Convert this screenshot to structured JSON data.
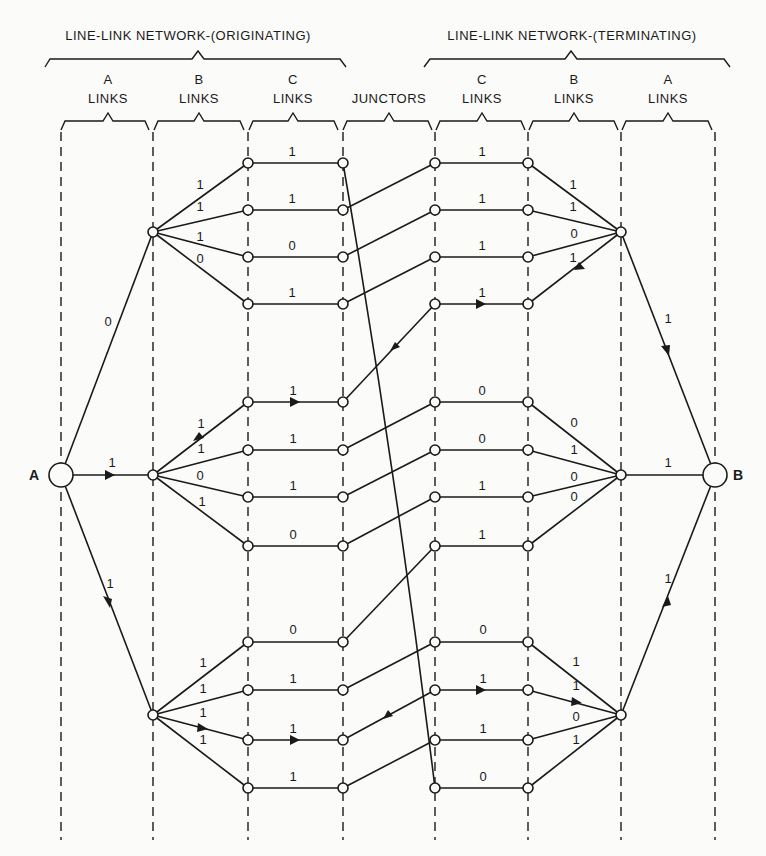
{
  "headers": {
    "originating": "LINE-LINK NETWORK-(ORIGINATING)",
    "terminating": "LINE-LINK NETWORK-(TERMINATING)"
  },
  "columns": [
    {
      "top": "A",
      "bottom": "LINKS"
    },
    {
      "top": "B",
      "bottom": "LINKS"
    },
    {
      "top": "C",
      "bottom": "LINKS"
    },
    {
      "top": "",
      "bottom": "JUNCTORS"
    },
    {
      "top": "C",
      "bottom": "LINKS"
    },
    {
      "top": "B",
      "bottom": "LINKS"
    },
    {
      "top": "A",
      "bottom": "LINKS"
    }
  ],
  "terminals": {
    "left": "A",
    "right": "B"
  },
  "bits": {
    "a_left_top": "0",
    "a_left_mid": "1",
    "a_left_bot": "1",
    "a_right_top": "1",
    "a_right_mid": "1",
    "a_right_bot": "1",
    "bl_top": [
      "1",
      "1",
      "1",
      "0"
    ],
    "bl_mid": [
      "1",
      "1",
      "0",
      "1"
    ],
    "bl_bot": [
      "1",
      "1",
      "1",
      "1"
    ],
    "cl_top": [
      "1",
      "1",
      "0",
      "1"
    ],
    "cl_mid": [
      "1",
      "1",
      "1",
      "0"
    ],
    "cl_bot": [
      "0",
      "1",
      "1",
      "1"
    ],
    "cr_top": [
      "1",
      "1",
      "1",
      "1"
    ],
    "cr_mid": [
      "0",
      "0",
      "1",
      "1"
    ],
    "cr_bot": [
      "0",
      "1",
      "1",
      "0"
    ],
    "br_top": [
      "1",
      "1",
      "0",
      "1"
    ],
    "br_mid": [
      "0",
      "1",
      "0",
      "0"
    ],
    "br_bot": [
      "1",
      "1",
      "0",
      "1"
    ]
  }
}
